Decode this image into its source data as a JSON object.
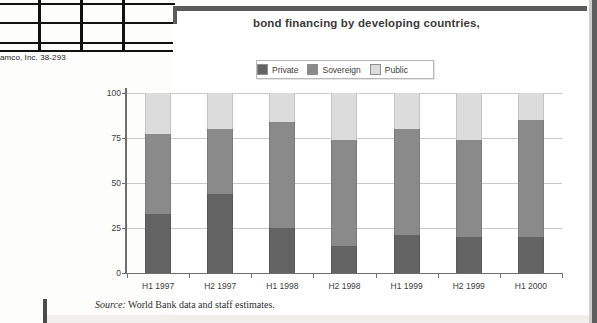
{
  "document": {
    "table_fragment_credit": "amco, Inc. 38-293"
  },
  "figure": {
    "title": "bond financing by developing countries,",
    "source_label": "Source:",
    "source_text": " World Bank data and staff estimates."
  },
  "legend": {
    "position": "top",
    "items": [
      {
        "label": "Private",
        "color": "#636363"
      },
      {
        "label": "Sovereign",
        "color": "#8a8a8a"
      },
      {
        "label": "Public",
        "color": "#dcdcdc"
      }
    ]
  },
  "chart_data": {
    "type": "bar",
    "stacked": true,
    "title": "bond financing by developing countries,",
    "xlabel": "",
    "ylabel": "",
    "ylim": [
      0,
      100
    ],
    "yticks": [
      0,
      25,
      50,
      75,
      100
    ],
    "grid": true,
    "categories": [
      "H1 1997",
      "H2 1997",
      "H1 1998",
      "H2 1998",
      "H1 1999",
      "H2 1999",
      "H1 2000"
    ],
    "series": [
      {
        "name": "Private",
        "color": "#636363",
        "values": [
          33,
          44,
          25,
          15,
          21,
          20,
          20
        ]
      },
      {
        "name": "Sovereign",
        "color": "#8a8a8a",
        "values": [
          44,
          36,
          59,
          59,
          59,
          54,
          65
        ]
      },
      {
        "name": "Public",
        "color": "#dcdcdc",
        "values": [
          23,
          20,
          16,
          26,
          20,
          26,
          15
        ]
      }
    ],
    "cumulative_tops": [
      {
        "category": "H1 1997",
        "private": 33,
        "sovereign": 77,
        "public": 100
      },
      {
        "category": "H2 1997",
        "private": 44,
        "sovereign": 80,
        "public": 100
      },
      {
        "category": "H1 1998",
        "private": 25,
        "sovereign": 84,
        "public": 100
      },
      {
        "category": "H2 1998",
        "private": 15,
        "sovereign": 74,
        "public": 100
      },
      {
        "category": "H1 1999",
        "private": 21,
        "sovereign": 80,
        "public": 100
      },
      {
        "category": "H2 1999",
        "private": 20,
        "sovereign": 74,
        "public": 100
      },
      {
        "category": "H1 2000",
        "private": 20,
        "sovereign": 85,
        "public": 100
      }
    ]
  }
}
